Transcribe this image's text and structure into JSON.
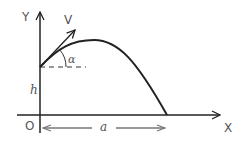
{
  "diagram": {
    "type": "projectile-motion",
    "labels": {
      "y_axis": "Y",
      "x_axis": "X",
      "origin": "O",
      "velocity": "V",
      "angle": "α",
      "height": "h",
      "distance": "a"
    },
    "colors": {
      "stroke": "#222222",
      "label": "#555555",
      "dim_arrow": "#777777"
    }
  }
}
